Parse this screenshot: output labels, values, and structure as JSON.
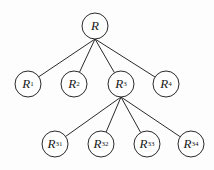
{
  "diagram": {
    "type": "tree",
    "nodes": [
      {
        "id": "R",
        "base": "R",
        "sub": "",
        "x": 95,
        "y": 26
      },
      {
        "id": "R1",
        "base": "R",
        "sub": "1",
        "x": 28,
        "y": 84
      },
      {
        "id": "R2",
        "base": "R",
        "sub": "2",
        "x": 74,
        "y": 84
      },
      {
        "id": "R3",
        "base": "R",
        "sub": "3",
        "x": 121,
        "y": 84
      },
      {
        "id": "R4",
        "base": "R",
        "sub": "4",
        "x": 166,
        "y": 84
      },
      {
        "id": "R31",
        "base": "R",
        "sub": "31",
        "x": 55,
        "y": 144
      },
      {
        "id": "R32",
        "base": "R",
        "sub": "32",
        "x": 101,
        "y": 144
      },
      {
        "id": "R33",
        "base": "R",
        "sub": "33",
        "x": 147,
        "y": 144
      },
      {
        "id": "R34",
        "base": "R",
        "sub": "34",
        "x": 191,
        "y": 144
      }
    ],
    "edges": [
      {
        "from": "R",
        "to": "R1"
      },
      {
        "from": "R",
        "to": "R2"
      },
      {
        "from": "R",
        "to": "R3"
      },
      {
        "from": "R",
        "to": "R4"
      },
      {
        "from": "R3",
        "to": "R31"
      },
      {
        "from": "R3",
        "to": "R32"
      },
      {
        "from": "R3",
        "to": "R33"
      },
      {
        "from": "R3",
        "to": "R34"
      }
    ]
  }
}
